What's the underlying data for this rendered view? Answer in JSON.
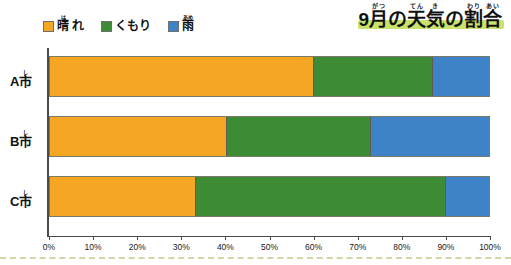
{
  "title": {
    "full_text": "9月の天気の割合",
    "parts": [
      {
        "base": "9",
        "ruby": ""
      },
      {
        "base": "月",
        "ruby": "がつ"
      },
      {
        "base": "の",
        "ruby": ""
      },
      {
        "base": "天",
        "ruby": "てん"
      },
      {
        "base": "気",
        "ruby": "き"
      },
      {
        "base": "の",
        "ruby": ""
      },
      {
        "base": "割",
        "ruby": "わり"
      },
      {
        "base": "合",
        "ruby": "あい"
      }
    ],
    "highlight_color": "#c9e26b"
  },
  "legend": {
    "items": [
      {
        "label": "晴れ",
        "base": "晴",
        "ruby": "は",
        "tail": "れ",
        "color": "#f5a623",
        "key": "sunny"
      },
      {
        "label": "くもり",
        "base": "くもり",
        "ruby": "",
        "tail": "",
        "color": "#3e8b35",
        "key": "cloudy"
      },
      {
        "label": "雨",
        "base": "雨",
        "ruby": "あめ",
        "tail": "",
        "color": "#3e82c8",
        "key": "rain"
      }
    ]
  },
  "chart_data": {
    "type": "bar",
    "orientation": "horizontal",
    "stacked": true,
    "normalized_percent": true,
    "xlabel": "",
    "ylabel": "",
    "xlim": [
      0,
      100
    ],
    "grid": false,
    "legend_position": "top-left",
    "categories": [
      "A市",
      "B市",
      "C市"
    ],
    "category_parts": [
      {
        "letter": "A",
        "base": "市",
        "ruby": "し"
      },
      {
        "letter": "B",
        "base": "市",
        "ruby": "し"
      },
      {
        "letter": "C",
        "base": "市",
        "ruby": "し"
      }
    ],
    "tick_labels": [
      "0%",
      "10%",
      "20%",
      "30%",
      "40%",
      "50%",
      "60%",
      "70%",
      "80%",
      "90%",
      "100%"
    ],
    "tick_values": [
      0,
      10,
      20,
      30,
      40,
      50,
      60,
      70,
      80,
      90,
      100
    ],
    "series": [
      {
        "name": "晴れ",
        "color": "#f5a623",
        "values": [
          60,
          40,
          33
        ]
      },
      {
        "name": "くもり",
        "color": "#3e8b35",
        "values": [
          27,
          33,
          57
        ]
      },
      {
        "name": "雨",
        "color": "#3e82c8",
        "values": [
          13,
          27,
          10
        ]
      }
    ],
    "rows": [
      {
        "category": "A市",
        "segments": [
          {
            "name": "晴れ",
            "key": "sunny",
            "value": 60,
            "start": 0,
            "end": 60
          },
          {
            "name": "くもり",
            "key": "cloudy",
            "value": 27,
            "start": 60,
            "end": 87
          },
          {
            "name": "雨",
            "key": "rain",
            "value": 13,
            "start": 87,
            "end": 100
          }
        ]
      },
      {
        "category": "B市",
        "segments": [
          {
            "name": "晴れ",
            "key": "sunny",
            "value": 40,
            "start": 0,
            "end": 40
          },
          {
            "name": "くもり",
            "key": "cloudy",
            "value": 33,
            "start": 40,
            "end": 73
          },
          {
            "name": "雨",
            "key": "rain",
            "value": 27,
            "start": 73,
            "end": 100
          }
        ]
      },
      {
        "category": "C市",
        "segments": [
          {
            "name": "晴れ",
            "key": "sunny",
            "value": 33,
            "start": 0,
            "end": 33
          },
          {
            "name": "くもり",
            "key": "cloudy",
            "value": 57,
            "start": 33,
            "end": 90
          },
          {
            "name": "雨",
            "key": "rain",
            "value": 10,
            "start": 90,
            "end": 100
          }
        ]
      }
    ]
  }
}
